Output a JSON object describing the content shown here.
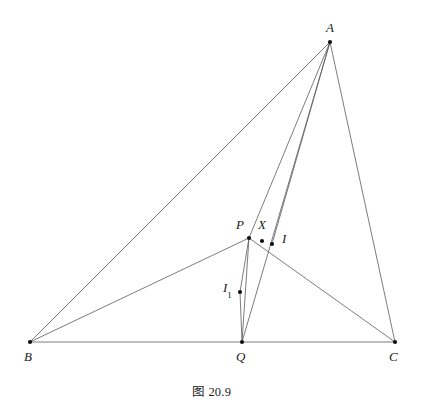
{
  "figure": {
    "caption": "图 20.9",
    "background_color": "#ffffff",
    "line_color": "#5a5a5a",
    "point_color": "#111111",
    "label_color": "#1a1a1a",
    "line_width": 0.8,
    "point_radius": 2.1,
    "width": 423,
    "height": 410
  },
  "points": {
    "A": {
      "label": "A",
      "x": 330,
      "y": 42,
      "label_x": 326,
      "label_y": 21
    },
    "B": {
      "label": "B",
      "x": 30,
      "y": 342,
      "label_x": 24,
      "label_y": 350
    },
    "C": {
      "label": "C",
      "x": 395,
      "y": 342,
      "label_x": 389,
      "label_y": 350
    },
    "Q": {
      "label": "Q",
      "x": 242,
      "y": 342,
      "label_x": 236,
      "label_y": 350
    },
    "P": {
      "label": "P",
      "x": 249,
      "y": 238,
      "label_x": 236,
      "label_y": 218
    },
    "X": {
      "label": "X",
      "x": 262,
      "y": 241,
      "label_x": 258,
      "label_y": 218
    },
    "I": {
      "label": "I",
      "x": 272,
      "y": 244,
      "label_x": 282,
      "label_y": 232
    },
    "I1": {
      "label": "I",
      "subscript": "1",
      "x": 240,
      "y": 292,
      "label_x": 223,
      "label_y": 281
    }
  },
  "segments": [
    {
      "name": "side-BC",
      "from": "B",
      "to": "C"
    },
    {
      "name": "side-AB",
      "from": "A",
      "to": "B"
    },
    {
      "name": "side-AC",
      "from": "A",
      "to": "C"
    },
    {
      "name": "cevian-AQ",
      "from": "A",
      "to": "Q"
    },
    {
      "name": "segment-AP",
      "from": "A",
      "to": "P"
    },
    {
      "name": "segment-AI",
      "from": "A",
      "to": "I"
    },
    {
      "name": "segment-BP",
      "from": "B",
      "to": "P"
    },
    {
      "name": "segment-PQ",
      "from": "P",
      "to": "Q"
    },
    {
      "name": "segment-PC",
      "from": "P",
      "to": "C"
    },
    {
      "name": "segment-PI1",
      "from": "P",
      "to": "I1"
    },
    {
      "name": "segment-I1Q",
      "from": "I1",
      "to": "Q"
    }
  ]
}
